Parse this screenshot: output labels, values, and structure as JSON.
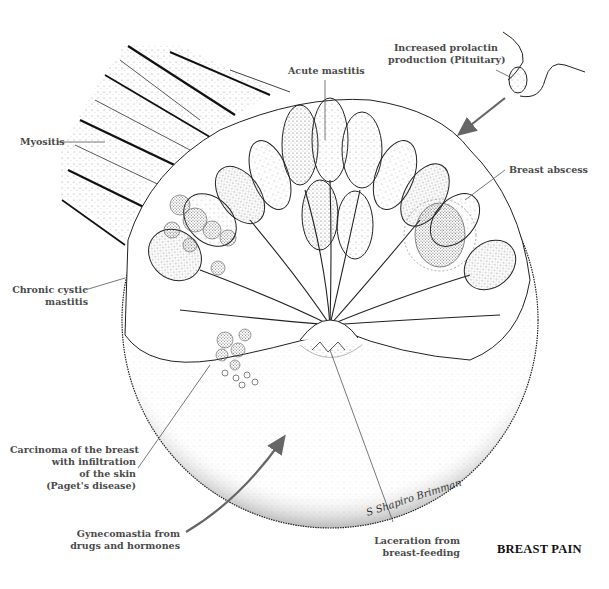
{
  "figure": {
    "title": "BREAST PAIN",
    "signature": "S Shapiro Brimman",
    "colors": {
      "ink": "#111111",
      "label_text": "#4a4a4a",
      "leader_line": "#555555",
      "stipple": "#6b6b6b",
      "background": "#ffffff"
    }
  },
  "labels": {
    "prolactin": {
      "lines": [
        "Increased prolactin",
        "production (Pituitary)"
      ]
    },
    "acute_mastitis": {
      "lines": [
        "Acute mastitis"
      ]
    },
    "myositis": {
      "lines": [
        "Myositis"
      ]
    },
    "breast_abscess": {
      "lines": [
        "Breast abscess"
      ]
    },
    "chronic_cystic": {
      "lines": [
        "Chronic cystic",
        "mastitis"
      ]
    },
    "carcinoma": {
      "lines": [
        "Carcinoma of the breast",
        "with infiltration",
        "of the skin",
        "(Paget's disease)"
      ]
    },
    "gynecomastia": {
      "lines": [
        "Gynecomastia from",
        "drugs and hormones"
      ]
    },
    "laceration": {
      "lines": [
        "Laceration from",
        "breast-feeding"
      ]
    }
  }
}
